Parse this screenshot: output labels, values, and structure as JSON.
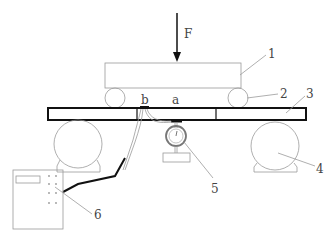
{
  "diagram": {
    "type": "mechanical test setup schematic",
    "force_label": "F",
    "point_labels": {
      "b": "b",
      "a": "a"
    },
    "callouts": [
      {
        "id": "1",
        "label": "1",
        "refers_to": "upper loading beam"
      },
      {
        "id": "2",
        "label": "2",
        "refers_to": "loading roller"
      },
      {
        "id": "3",
        "label": "3",
        "refers_to": "specimen beam"
      },
      {
        "id": "4",
        "label": "4",
        "refers_to": "support roller"
      },
      {
        "id": "5",
        "label": "5",
        "refers_to": "dial gauge"
      },
      {
        "id": "6",
        "label": "6",
        "refers_to": "strain acquisition box"
      }
    ],
    "colors": {
      "line": "#9a9a9a",
      "bold": "#111111",
      "text": "#444444"
    }
  }
}
